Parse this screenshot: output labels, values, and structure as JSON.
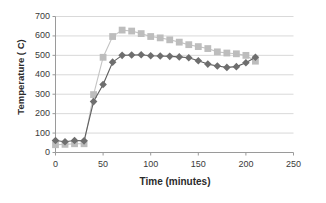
{
  "chart_data": {
    "type": "line",
    "title": "",
    "xlabel": "Time (minutes)",
    "ylabel": "Temperature ( C)",
    "xlim": [
      0,
      250
    ],
    "ylim": [
      0,
      700
    ],
    "xticks": [
      0,
      50,
      100,
      150,
      200,
      250
    ],
    "yticks": [
      0,
      100,
      200,
      300,
      400,
      500,
      600,
      700
    ],
    "grid": "horizontal",
    "legend": "none",
    "background_color": "#ffffff",
    "x": [
      0,
      10,
      20,
      30,
      40,
      50,
      60,
      70,
      80,
      90,
      100,
      110,
      120,
      130,
      140,
      150,
      160,
      170,
      180,
      190,
      200,
      210
    ],
    "series": [
      {
        "name": "series-diamond",
        "marker": "diamond",
        "color": "#6e6e6e",
        "line_color": "#5f5f5f",
        "values": [
          62,
          55,
          62,
          60,
          262,
          350,
          465,
          500,
          502,
          503,
          498,
          497,
          495,
          492,
          488,
          472,
          455,
          445,
          438,
          442,
          462,
          490
        ]
      },
      {
        "name": "series-square",
        "marker": "square",
        "color": "#bdbdbd",
        "line_color": "#c4c4c4",
        "values": [
          40,
          42,
          45,
          45,
          298,
          490,
          597,
          630,
          625,
          612,
          597,
          590,
          580,
          568,
          555,
          545,
          535,
          518,
          512,
          508,
          500,
          470
        ]
      }
    ]
  }
}
